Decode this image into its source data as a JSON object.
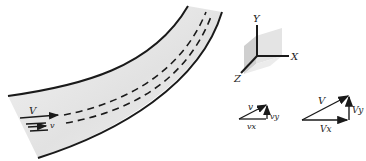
{
  "pipe": {
    "flow_label_V": "V",
    "flow_label_v": "v"
  },
  "axes": {
    "x_label": "X",
    "y_label": "Y",
    "z_label": "Z"
  },
  "small_triangle": {
    "hyp_label": "v",
    "horizontal_label": "vx",
    "vertical_label": "vy"
  },
  "large_triangle": {
    "hyp_label": "V",
    "horizontal_label": "Vx",
    "vertical_label": "Vy"
  },
  "colors": {
    "line": "#1a1a1a",
    "pipe_shade": "#e6e6e6",
    "cube_shade": "#dcdcdc"
  }
}
